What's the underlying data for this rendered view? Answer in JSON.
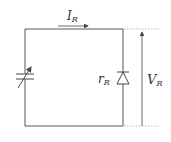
{
  "diagram": {
    "title": "",
    "labels": {
      "current": {
        "main": "I",
        "sub": "R"
      },
      "resistance": {
        "main": "r",
        "sub": "R"
      },
      "voltage": {
        "main": "V",
        "sub": "R"
      }
    },
    "components": [
      {
        "type": "variable-capacitor",
        "position": "left-branch"
      },
      {
        "type": "diode",
        "orientation": "cathode-up",
        "position": "right-branch",
        "label": "r_R"
      }
    ],
    "annotations": [
      {
        "type": "current-arrow",
        "direction": "right",
        "label": "I_R"
      },
      {
        "type": "voltage-arrow",
        "direction": "up",
        "label": "V_R"
      }
    ],
    "colors": {
      "line": "#555555",
      "dotted": "#aaaaaa",
      "text": "#333333"
    }
  }
}
